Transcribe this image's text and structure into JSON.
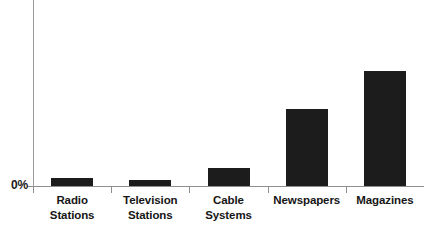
{
  "chart_data": {
    "type": "bar",
    "title": "",
    "subtitle": "",
    "xlabel": "",
    "ylabel": "",
    "categories": [
      "Radio Stations",
      "Television Stations",
      "Cable Systems",
      "Newspapers",
      "Magazines"
    ],
    "category_lines": [
      [
        "Radio",
        "Stations"
      ],
      [
        "Television",
        "Stations"
      ],
      [
        "Cable",
        "Systems"
      ],
      [
        "Newspapers",
        ""
      ],
      [
        "Magazines",
        ""
      ]
    ],
    "values": [
      0.7,
      0.5,
      1.6,
      6.7,
      10.0
    ],
    "value_unit": "%",
    "ylim": [
      0,
      16.2
    ],
    "ytick_labels": [
      "0%"
    ],
    "ytick_values": [
      0
    ],
    "grid": false,
    "legend": null,
    "bar_color": "#1c1c1c",
    "axis_color": "#8e8e8e",
    "background_color": "#ffffff",
    "bar_pixel_heights": [
      8,
      6,
      18,
      77,
      115
    ],
    "plot_pixel_height": 186
  }
}
